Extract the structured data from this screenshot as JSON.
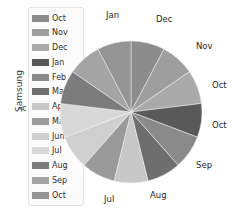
{
  "axis": {
    "group_label": "Samsung",
    "sub_label": "A"
  },
  "legend": {
    "items": [
      {
        "label": "Oct",
        "color": "#8c8c8c"
      },
      {
        "label": "Nov",
        "color": "#9e9e9e"
      },
      {
        "label": "Dec",
        "color": "#aaaaaa"
      },
      {
        "label": "Jan",
        "color": "#595959"
      },
      {
        "label": "Feb",
        "color": "#8a8a8a"
      },
      {
        "label": "Mar",
        "color": "#6e6e6e"
      },
      {
        "label": "Apr",
        "color": "#c8c8c8"
      },
      {
        "label": "May",
        "color": "#9a9a9a"
      },
      {
        "label": "Jun",
        "color": "#cfcfcf"
      },
      {
        "label": "Jul",
        "color": "#d8d8d8"
      },
      {
        "label": "Aug",
        "color": "#7c7c7c"
      },
      {
        "label": "Sep",
        "color": "#a4a4a4"
      },
      {
        "label": "Oct",
        "color": "#949494"
      }
    ]
  },
  "chart_data": {
    "type": "pie",
    "title": "",
    "xlabel": "",
    "ylabel": "Samsung",
    "legend_position": "left",
    "grid": false,
    "categories": [
      "Oct",
      "Nov",
      "Dec",
      "Jan",
      "Feb",
      "Mar",
      "Apr",
      "May",
      "Jun",
      "Jul",
      "Aug",
      "Sep",
      "Oct"
    ],
    "values": [
      7.7,
      7.7,
      7.7,
      7.7,
      7.7,
      7.7,
      7.7,
      7.7,
      7.7,
      7.7,
      7.7,
      7.7,
      7.7
    ],
    "colors": [
      "#8c8c8c",
      "#9e9e9e",
      "#aaaaaa",
      "#595959",
      "#8a8a8a",
      "#6e6e6e",
      "#c8c8c8",
      "#9a9a9a",
      "#cfcfcf",
      "#d8d8d8",
      "#7c7c7c",
      "#a4a4a4",
      "#949494"
    ],
    "outer_labels": [
      {
        "text": "Jan",
        "x": 22,
        "y": 2
      },
      {
        "text": "Dec",
        "x": 72,
        "y": 6
      },
      {
        "text": "Nov",
        "x": 112,
        "y": 33
      },
      {
        "text": "Oct",
        "x": 128,
        "y": 72
      },
      {
        "text": "Oct",
        "x": 128,
        "y": 112
      },
      {
        "text": "Sep",
        "x": 112,
        "y": 152
      },
      {
        "text": "Aug",
        "x": 66,
        "y": 182
      },
      {
        "text": "Jul",
        "x": 20,
        "y": 186
      }
    ]
  }
}
